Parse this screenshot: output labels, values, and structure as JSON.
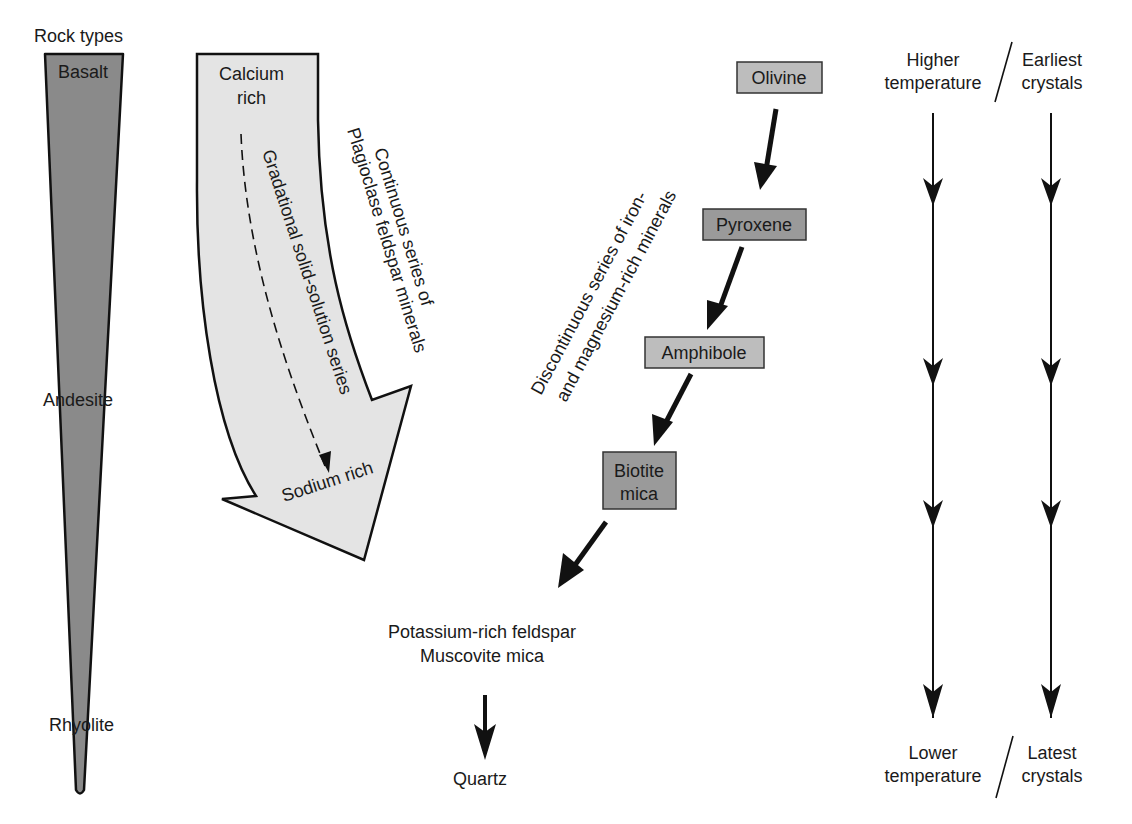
{
  "rock_types": {
    "title": "Rock types",
    "items": [
      "Basalt",
      "Andesite",
      "Rhyolite"
    ],
    "fill_color": "#8a8a8a"
  },
  "continuous_series": {
    "top_label_line1": "Calcium",
    "top_label_line2": "rich",
    "bottom_label": "Sodium rich",
    "inner_label": "Gradational solid-solution series",
    "side_label_line1": "Continuous series of",
    "side_label_line2": "Plagioclase feldspar minerals",
    "fill_color": "#e4e4e4"
  },
  "discontinuous_series": {
    "side_label_line1": "Discontinuous series of iron-",
    "side_label_line2": "and magnesium-rich minerals",
    "minerals": [
      {
        "name": "Olivine",
        "fill": "#bdbdbd"
      },
      {
        "name": "Pyroxene",
        "fill": "#9a9a9a"
      },
      {
        "name": "Amphibole",
        "fill": "#bdbdbd"
      },
      {
        "name_line1": "Biotite",
        "name_line2": "mica",
        "fill": "#9a9a9a"
      }
    ]
  },
  "final_minerals": {
    "line1": "Potassium-rich feldspar",
    "line2": "Muscovite mica",
    "last": "Quartz"
  },
  "temperature_scale": {
    "top_left_line1": "Higher",
    "top_left_line2": "temperature",
    "top_right_line1": "Earliest",
    "top_right_line2": "crystals",
    "bottom_left_line1": "Lower",
    "bottom_left_line2": "temperature",
    "bottom_right_line1": "Latest",
    "bottom_right_line2": "crystals"
  }
}
